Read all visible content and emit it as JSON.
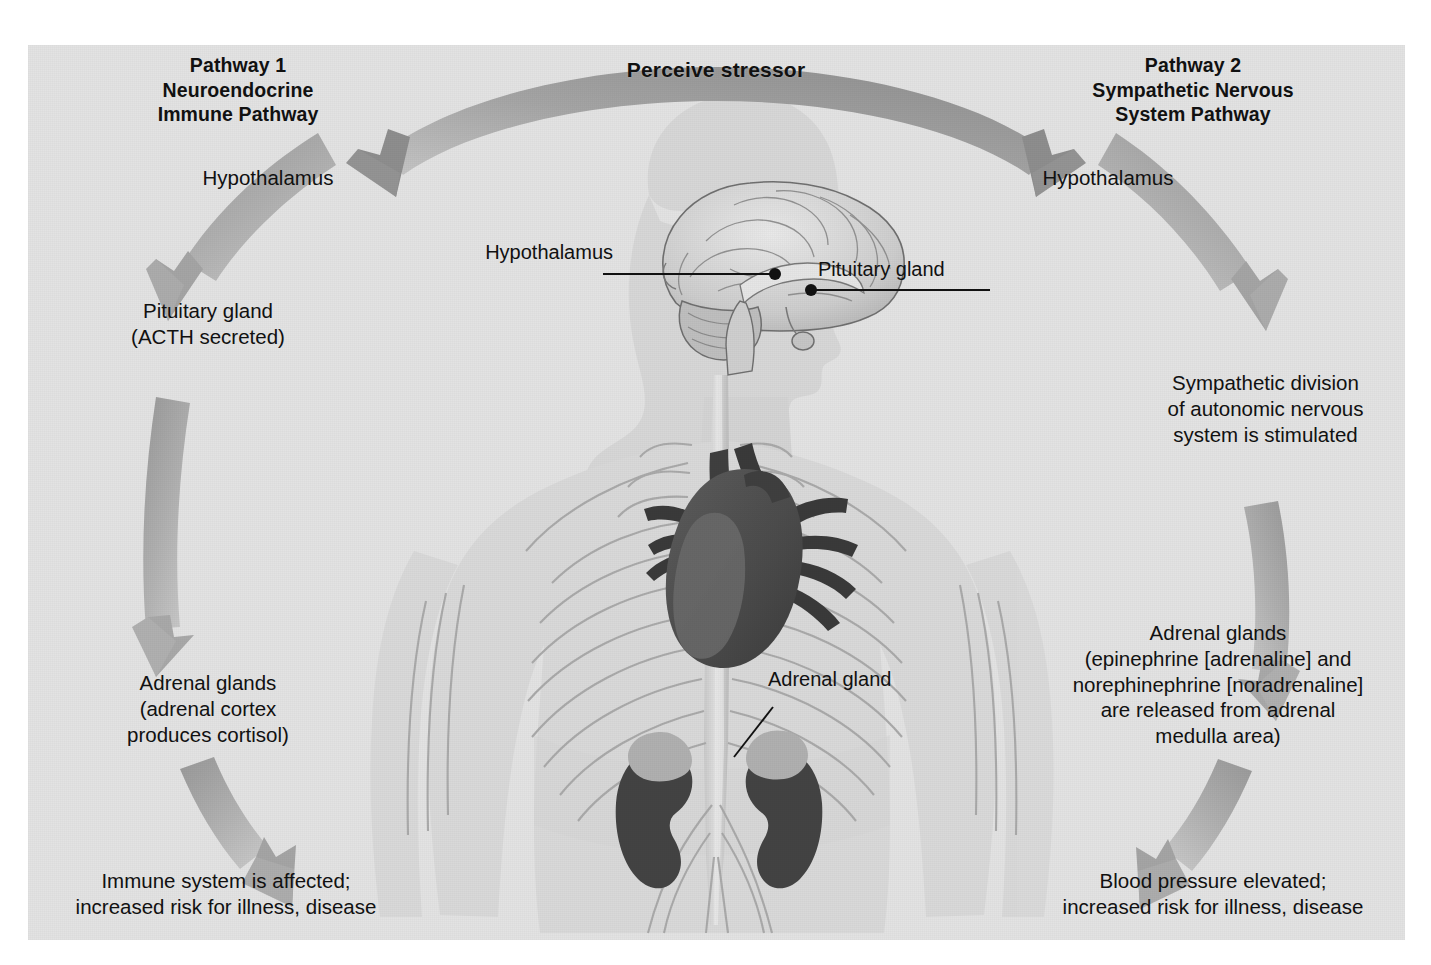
{
  "figure": {
    "background_color": "#e3e3e3",
    "arrow_color_dark": "#8e8e8e",
    "arrow_color_light": "#c2c2c2",
    "organ_dark": "#4a4a4a",
    "organ_mid": "#6e6e6e",
    "organ_light": "#b5b5b5",
    "body_fill": "#d5d5d5"
  },
  "arc": {
    "title": "Perceive stressor",
    "direction": "branches left and right from center"
  },
  "pathways": {
    "left": {
      "title": "Pathway 1\nNeuroendocrine\nImmune Pathway",
      "steps": [
        "Hypothalamus",
        "Pituitary gland\n(ACTH secreted)",
        "Adrenal glands\n(adrenal cortex\nproduces cortisol)",
        "Immune system is affected;\nincreased risk for illness, disease"
      ]
    },
    "right": {
      "title": "Pathway 2\nSympathetic Nervous\nSystem Pathway",
      "steps": [
        "Hypothalamus",
        "Sympathetic division\nof autonomic nervous\nsystem is stimulated",
        "Adrenal glands\n(epinephrine [adrenaline] and\nnorephinephrine [noradrenaline]\nare released from adrenal\nmedulla area)",
        "Blood pressure elevated;\nincreased risk for illness, disease"
      ]
    }
  },
  "anatomy_callouts": [
    {
      "label": "Hypothalamus",
      "side": "left"
    },
    {
      "label": "Pituitary gland",
      "side": "right"
    },
    {
      "label": "Adrenal gland",
      "side": "right"
    }
  ]
}
